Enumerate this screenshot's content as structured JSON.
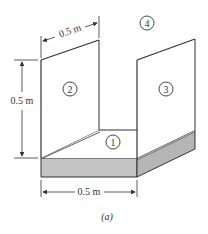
{
  "figure": {
    "caption": "(a)",
    "surfaces": [
      {
        "id": "1",
        "label": "1",
        "description": "floor"
      },
      {
        "id": "2",
        "label": "2",
        "description": "left wall"
      },
      {
        "id": "3",
        "label": "3",
        "description": "right wall"
      },
      {
        "id": "4",
        "label": "4",
        "description": "surroundings"
      }
    ],
    "dimensions": {
      "top_depth": "0.5 m",
      "left_height": "0.5 m",
      "bottom_width": "0.5 m"
    },
    "colors": {
      "line": "#333333",
      "slab_fill": "#c4c4c4",
      "slab_side_fill": "#b5b5b5",
      "background": "#ffffff"
    }
  }
}
